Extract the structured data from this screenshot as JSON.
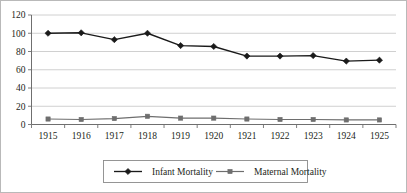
{
  "chart_data": {
    "type": "line",
    "title": "",
    "subtitle": "",
    "xlabel": "",
    "ylabel": "",
    "categories": [
      "1915",
      "1916",
      "1917",
      "1918",
      "1919",
      "1920",
      "1921",
      "1922",
      "1923",
      "1924",
      "1925"
    ],
    "series": [
      {
        "name": "Infant Mortality",
        "marker": "diamond",
        "color": "#1a1a1a",
        "values": [
          100,
          100.5,
          93,
          100,
          86.5,
          85.5,
          75,
          75,
          75.5,
          69.5,
          70.5
        ]
      },
      {
        "name": "Maternal Mortality",
        "marker": "square",
        "color": "#6e6e6e",
        "values": [
          6,
          5.5,
          6.5,
          9,
          7,
          7,
          6,
          5.5,
          5.5,
          5,
          5
        ]
      }
    ],
    "ylim": [
      0,
      120
    ],
    "y_ticks": [
      0,
      20,
      40,
      60,
      80,
      100,
      120
    ],
    "y_tick_labels": [
      "0",
      "20",
      "40",
      "60",
      "80",
      "100",
      "120"
    ],
    "x_tick_labels": [
      "1915",
      "1916",
      "1917",
      "1918",
      "1919",
      "1920",
      "1921",
      "1922",
      "1923",
      "1924",
      "1925"
    ],
    "grid": true,
    "grid_axis": "y",
    "legend_position": "bottom",
    "legend_entries": [
      "Infant Mortality",
      "Maternal Mortality"
    ]
  },
  "legend": {
    "entry_1_label": "Infant Mortality",
    "entry_2_label": "Maternal Mortality"
  },
  "colors": {
    "series_1": "#1a1a1a",
    "series_2": "#6e6e6e",
    "gridline": "#c4c4c4",
    "axis": "#6f6f6f",
    "frame": "#b9b9b9",
    "text": "#231f20",
    "background": "#ffffff"
  }
}
